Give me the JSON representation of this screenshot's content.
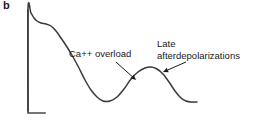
{
  "figure": {
    "panel_label": "b",
    "background_color": "#ffffff",
    "trace_color": "#3a3a3a",
    "axis_color": "#4a4a4a",
    "text_color": "#1a1a1a"
  },
  "annotations": [
    {
      "id": "ca-overload",
      "text": "Ca++ overload",
      "lines": [
        "Ca++ overload"
      ],
      "x": 69,
      "y": 48,
      "arrow": {
        "from_x": 116,
        "from_y": 62,
        "to_x": 136,
        "to_y": 80
      }
    },
    {
      "id": "late-afterdepolarizations",
      "text": "Late afterdepolarizations",
      "lines": [
        "Late",
        "afterdepolarizations"
      ],
      "x": 157,
      "y": 38,
      "arrow": {
        "from_x": 186,
        "from_y": 62,
        "to_x": 163,
        "to_y": 72
      }
    }
  ],
  "chart_data": {
    "type": "line",
    "title": "",
    "xlabel": "",
    "ylabel": "",
    "grid": false,
    "legend": "none",
    "axis": {
      "style": "L-shaped scale bar",
      "vertical_x": 28,
      "vertical_top_y": 10,
      "vertical_bottom_y": 113,
      "horizontal_end_x": 45,
      "horizontal_y": 113
    },
    "series": [
      {
        "name": "cardiac action potential with delayed afterdepolarization",
        "path_points": [
          [
            28,
            111
          ],
          [
            28,
            9
          ],
          [
            31,
            13
          ],
          [
            34,
            18
          ],
          [
            37,
            21
          ],
          [
            41,
            23
          ],
          [
            46,
            24
          ],
          [
            51,
            26
          ],
          [
            56,
            31
          ],
          [
            61,
            38
          ],
          [
            67,
            47
          ],
          [
            73,
            57
          ],
          [
            79,
            68
          ],
          [
            85,
            80
          ],
          [
            91,
            90
          ],
          [
            97,
            97
          ],
          [
            103,
            101
          ],
          [
            110,
            101
          ],
          [
            117,
            97
          ],
          [
            124,
            89
          ],
          [
            131,
            79
          ],
          [
            138,
            72
          ],
          [
            145,
            68
          ],
          [
            151,
            67
          ],
          [
            157,
            69
          ],
          [
            163,
            74
          ],
          [
            169,
            82
          ],
          [
            175,
            91
          ],
          [
            181,
            98
          ],
          [
            186,
            101
          ],
          [
            191,
            102
          ],
          [
            197,
            102
          ]
        ]
      }
    ]
  }
}
